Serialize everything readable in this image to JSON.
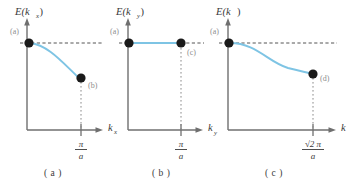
{
  "figure": {
    "type": "line",
    "background": "#ffffff",
    "curve_color": "#7ec4e4",
    "axis_color": "#6f6f6f",
    "point_color": "#1a1a1a",
    "dash_color": "#555555",
    "panels": [
      {
        "id": "panel-a",
        "caption": "( a )",
        "ylabel": "E(k",
        "ylabel_sub": "x",
        "ylabel_close": ")",
        "xlabel": "k",
        "xlabel_sub": "x",
        "tick_num": "π",
        "tick_den": "a",
        "points": [
          {
            "label": "(a)",
            "x": 0.0,
            "y": 1.0
          },
          {
            "label": "(b)",
            "x": 1.0,
            "y": 0.42
          }
        ],
        "shape": "descending-curve"
      },
      {
        "id": "panel-b",
        "caption": "( b )",
        "ylabel": "E(k",
        "ylabel_sub": "y",
        "ylabel_close": ")",
        "xlabel": "k",
        "xlabel_sub": "y",
        "tick_num": "π",
        "tick_den": "a",
        "points": [
          {
            "label": "(a)",
            "x": 0.0,
            "y": 1.0
          },
          {
            "label": "(c)",
            "x": 1.0,
            "y": 1.0
          }
        ],
        "shape": "flat-line"
      },
      {
        "id": "panel-c",
        "caption": "( c )",
        "ylabel": "E(k",
        "ylabel_sub": "",
        "ylabel_close": ")",
        "xlabel": "k",
        "xlabel_sub": "",
        "tick_num": "√2 π",
        "tick_den": "a",
        "points": [
          {
            "label": "(a)",
            "x": 0.0,
            "y": 1.0
          },
          {
            "label": "(d)",
            "x": 1.0,
            "y": 0.62
          }
        ],
        "shape": "sigmoid-descending-curve"
      }
    ]
  }
}
